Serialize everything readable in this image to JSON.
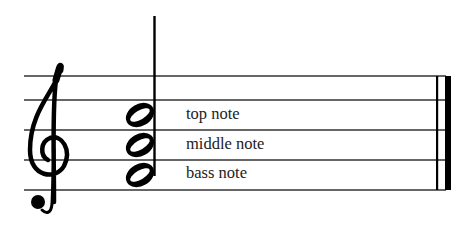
{
  "diagram": {
    "type": "music-staff",
    "clef": "treble-clef",
    "chord": {
      "notes": 3,
      "note_type": "half-note",
      "labels": [
        "top note",
        "middle note",
        "bass note"
      ]
    },
    "barline": "final-barline"
  }
}
